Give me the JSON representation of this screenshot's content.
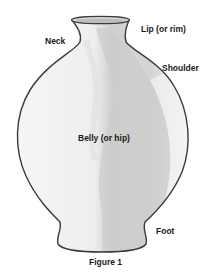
{
  "figure": {
    "caption": "Figure 1",
    "labels": {
      "neck": "Neck",
      "lip": "Lip (or rim)",
      "shoulder": "Shoulder",
      "belly": "Belly (or hip)",
      "foot": "Foot"
    },
    "colors": {
      "outline": "#3a3a3a",
      "body_light": "#f1f1f1",
      "body_shade": "#c9c9c9",
      "body_mid": "#dcdcdc",
      "text": "#1a1a1a"
    }
  }
}
